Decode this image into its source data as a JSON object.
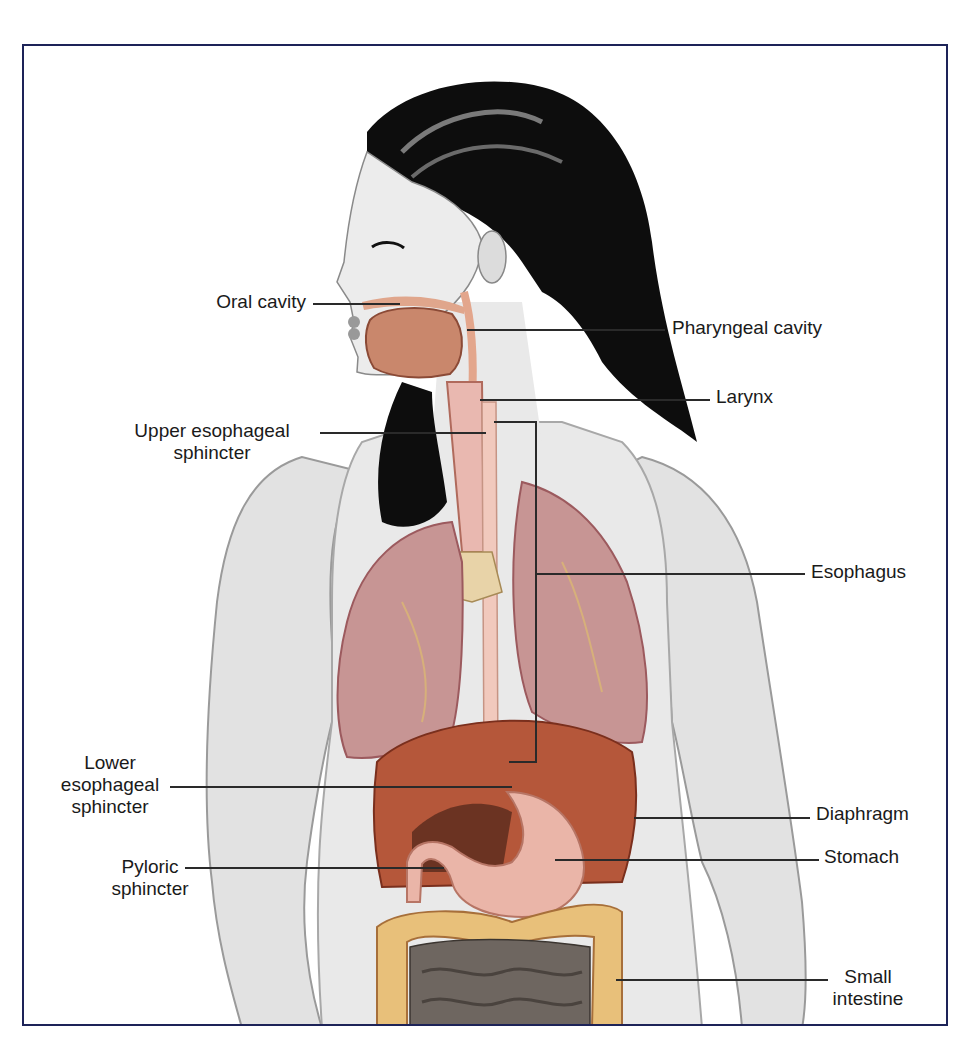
{
  "figure": {
    "type": "anatomical-illustration",
    "colors": {
      "frame_border": "#1d2358",
      "leader_line": "#2a2a2a",
      "skin": "#e4e4e4",
      "hair": "#0c0c0c",
      "lung": "#c79594",
      "diaphragm": "#b5573a",
      "stomach": "#eab5a8",
      "large_intestine": "#e8c07a",
      "small_intestine": "#6e6660",
      "esophagus": "#f1c9bd"
    }
  },
  "labels": {
    "oral_cavity": "Oral cavity",
    "pharyngeal_cavity": "Pharyngeal cavity",
    "larynx": "Larynx",
    "upper_es_line1": "Upper esophageal",
    "upper_es_line2": "sphincter",
    "esophagus": "Esophagus",
    "lower_es_line1": "Lower",
    "lower_es_line2": "esophageal",
    "lower_es_line3": "sphincter",
    "diaphragm": "Diaphragm",
    "pyloric_line1": "Pyloric",
    "pyloric_line2": "sphincter",
    "stomach": "Stomach",
    "small_int_line1": "Small",
    "small_int_line2": "intestine"
  }
}
